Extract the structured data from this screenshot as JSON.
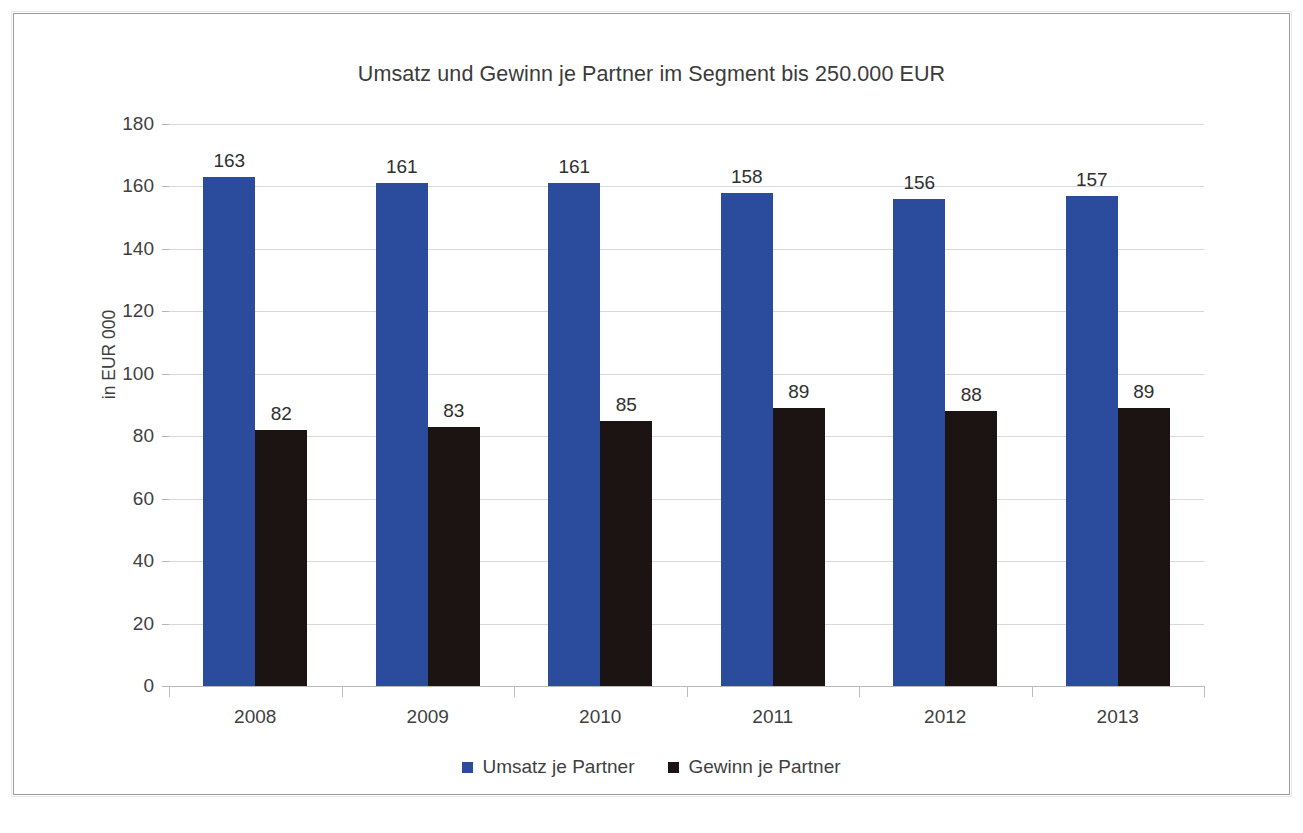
{
  "frame": {
    "visible": true,
    "border_color": "#9a9a9a"
  },
  "chart_data": {
    "type": "bar",
    "title": "Umsatz und Gewinn je Partner im Segment bis 250.000 EUR",
    "xlabel": "",
    "ylabel": "in EUR 000",
    "ylim": [
      0,
      180
    ],
    "ytick_step": 20,
    "yticks": [
      0,
      20,
      40,
      60,
      80,
      100,
      120,
      140,
      160,
      180
    ],
    "grid": true,
    "grid_axis": "y",
    "legend_position": "bottom",
    "data_labels": true,
    "categories": [
      "2008",
      "2009",
      "2010",
      "2011",
      "2012",
      "2013"
    ],
    "series": [
      {
        "name": "Umsatz je Partner",
        "color": "#2b4b9c",
        "values": [
          163,
          161,
          161,
          158,
          156,
          157
        ]
      },
      {
        "name": "Gewinn je Partner",
        "color": "#1c1412",
        "values": [
          82,
          83,
          85,
          89,
          88,
          89
        ]
      }
    ]
  }
}
